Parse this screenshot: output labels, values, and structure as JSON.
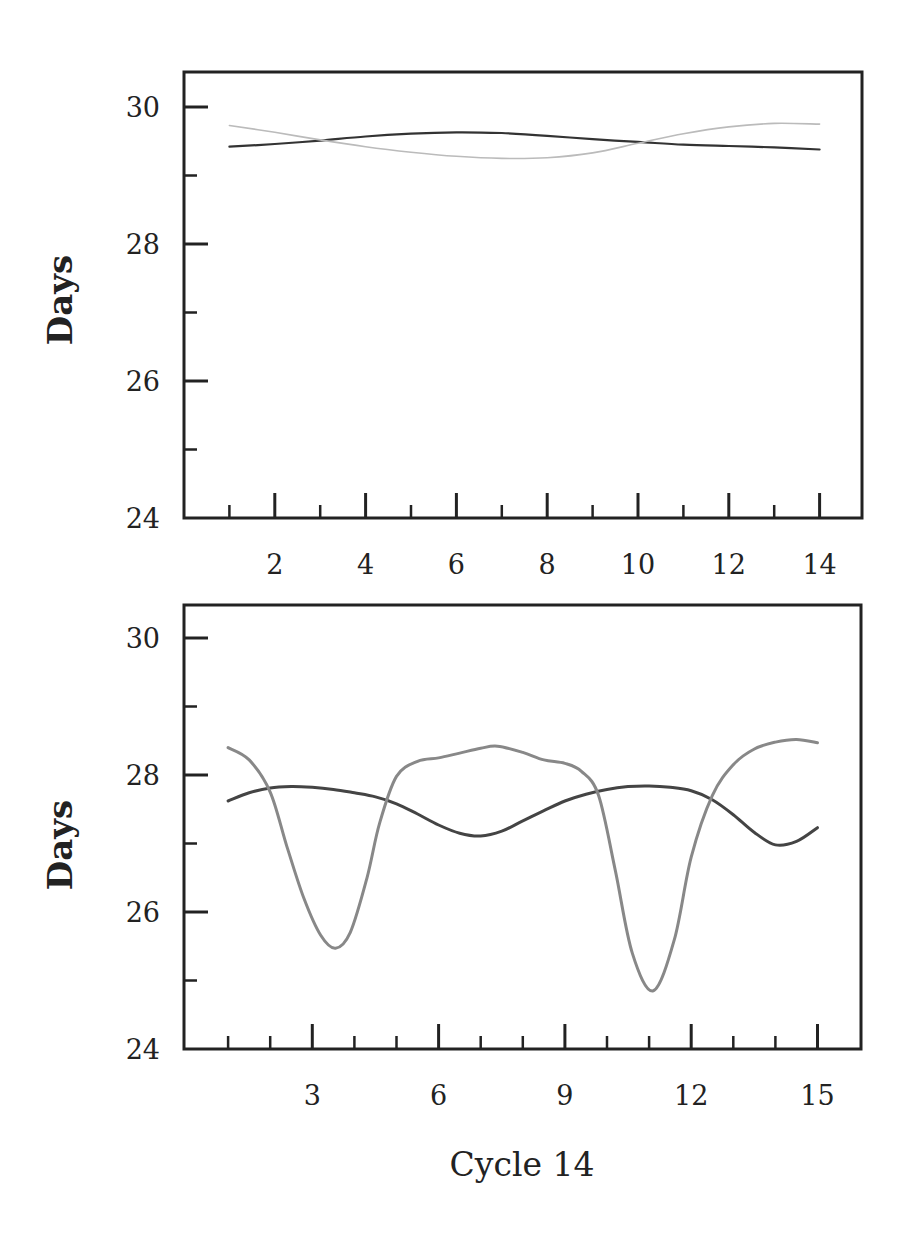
{
  "chart_data": [
    {
      "type": "line",
      "title": "",
      "xlabel": "",
      "ylabel": "Days",
      "xlim": [
        0,
        15.5
      ],
      "ylim": [
        24,
        30.5
      ],
      "grid": false,
      "legend": null,
      "x_ticks_major": [
        2,
        4,
        6,
        8,
        10,
        12,
        14
      ],
      "x_tick_labels": [
        "2",
        "4",
        "6",
        "8",
        "10",
        "12",
        "14"
      ],
      "x_ticks_minor": [
        1,
        3,
        5,
        7,
        9,
        11,
        13
      ],
      "y_ticks_major": [
        24,
        26,
        28,
        30
      ],
      "y_tick_labels": [
        "24",
        "26",
        "28",
        "30"
      ],
      "y_ticks_minor": [
        25,
        27,
        29
      ],
      "series": [
        {
          "name": "dark-series",
          "color": "#333333",
          "width": 2.2,
          "x": [
            1,
            2,
            3,
            4,
            5,
            6,
            7,
            8,
            9,
            10,
            11,
            12,
            13,
            14
          ],
          "values": [
            29.42,
            29.46,
            29.51,
            29.57,
            29.61,
            29.63,
            29.62,
            29.58,
            29.53,
            29.49,
            29.45,
            29.43,
            29.41,
            29.38
          ]
        },
        {
          "name": "light-series",
          "color": "#bbbbbb",
          "width": 1.6,
          "x": [
            1,
            2,
            3,
            4,
            5,
            6,
            7,
            8,
            9,
            10,
            11,
            12,
            13,
            14
          ],
          "values": [
            29.73,
            29.63,
            29.52,
            29.42,
            29.34,
            29.28,
            29.25,
            29.26,
            29.33,
            29.47,
            29.61,
            29.71,
            29.76,
            29.75
          ]
        }
      ]
    },
    {
      "type": "line",
      "title": "",
      "xlabel": "Cycle 14",
      "ylabel": "Days",
      "xlim": [
        0,
        16
      ],
      "ylim": [
        24,
        30.5
      ],
      "grid": false,
      "legend": null,
      "x_ticks_major": [
        3,
        6,
        9,
        12,
        15
      ],
      "x_tick_labels": [
        "3",
        "6",
        "9",
        "12",
        "15"
      ],
      "x_ticks_minor": [
        1,
        2,
        4,
        5,
        7,
        8,
        10,
        11,
        13,
        14
      ],
      "y_ticks_major": [
        24,
        26,
        28,
        30
      ],
      "y_tick_labels": [
        "24",
        "26",
        "28",
        "30"
      ],
      "y_ticks_minor": [
        25,
        27,
        29
      ],
      "series": [
        {
          "name": "dark-series",
          "color": "#444444",
          "width": 3,
          "x": [
            1,
            1.5,
            2,
            2.5,
            3,
            3.5,
            4,
            4.5,
            5,
            5.5,
            6,
            6.5,
            7,
            7.5,
            8,
            8.5,
            9,
            9.5,
            10,
            10.5,
            11,
            11.5,
            12,
            12.5,
            13,
            13.5,
            14,
            14.5,
            15
          ],
          "values": [
            27.62,
            27.74,
            27.81,
            27.83,
            27.82,
            27.79,
            27.74,
            27.68,
            27.58,
            27.43,
            27.27,
            27.15,
            27.11,
            27.18,
            27.33,
            27.48,
            27.62,
            27.72,
            27.79,
            27.83,
            27.84,
            27.82,
            27.77,
            27.64,
            27.42,
            27.16,
            26.98,
            27.03,
            27.23
          ]
        },
        {
          "name": "light-series",
          "color": "#888888",
          "width": 3,
          "x": [
            1,
            1.5,
            2,
            2.4,
            2.8,
            3.2,
            3.55,
            3.9,
            4.3,
            4.6,
            5.0,
            5.5,
            6,
            6.5,
            7,
            7.4,
            8,
            8.5,
            9,
            9.4,
            9.8,
            10.2,
            10.6,
            11.1,
            11.6,
            12.0,
            12.5,
            13,
            13.5,
            14,
            14.5,
            15
          ],
          "values": [
            28.4,
            28.22,
            27.75,
            26.95,
            26.2,
            25.66,
            25.47,
            25.7,
            26.5,
            27.3,
            27.98,
            28.2,
            28.25,
            28.32,
            28.39,
            28.42,
            28.33,
            28.22,
            28.17,
            28.05,
            27.7,
            26.6,
            25.4,
            24.85,
            25.6,
            26.8,
            27.7,
            28.15,
            28.38,
            28.48,
            28.52,
            28.47
          ]
        }
      ]
    }
  ],
  "figure": {
    "top_panel": {
      "ylabel": "Days",
      "frame": {
        "left": 184,
        "top": 72,
        "right": 862,
        "bottom": 518
      },
      "y_at_30": 107,
      "y_at_24": 518,
      "x_at_0": 184,
      "px_per_x": 45.4
    },
    "bottom_panel": {
      "ylabel": "Days",
      "xlabel": "Cycle 14",
      "frame": {
        "left": 184,
        "top": 605,
        "right": 861,
        "bottom": 1049
      },
      "y_at_30": 638,
      "y_at_24": 1049,
      "x_at_0": 186,
      "px_per_x": 42.1
    }
  }
}
